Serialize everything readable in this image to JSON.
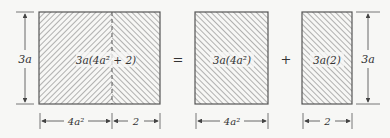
{
  "diagram": {
    "colors": {
      "stroke": "#555555",
      "hatch": "#8a8a8a",
      "background": "#f7f7f5",
      "text": "#333333"
    },
    "left_rect": {
      "label": "3a(4a² + 2)",
      "height_label": "3a",
      "width_labels": [
        "4a²",
        "2"
      ]
    },
    "equals": "=",
    "plus": "+",
    "middle_rect": {
      "label": "3a(4a²)",
      "width_label": "4a²"
    },
    "right_rect": {
      "label": "3a(2)",
      "width_label": "2",
      "height_label": "3a"
    }
  }
}
